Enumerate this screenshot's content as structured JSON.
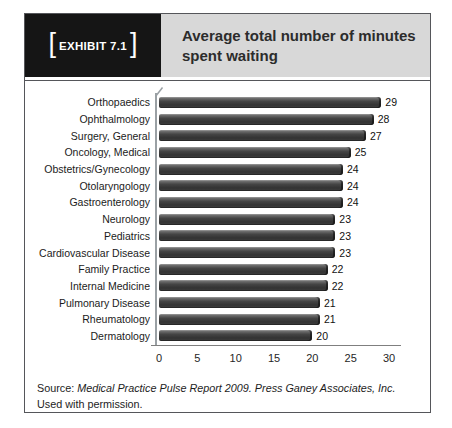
{
  "exhibit": {
    "bracket_left": "[",
    "label": "EXHIBIT 7.1",
    "bracket_right": "]"
  },
  "header": {
    "title": "Average total number of minutes spent waiting"
  },
  "chart_data": {
    "type": "bar",
    "orientation": "horizontal",
    "title": "Average total number of minutes spent waiting",
    "categories": [
      "Orthopaedics",
      "Ophthalmology",
      "Surgery, General",
      "Oncology, Medical",
      "Obstetrics/Gynecology",
      "Otolaryngology",
      "Gastroenterology",
      "Neurology",
      "Pediatrics",
      "Cardiovascular Disease",
      "Family Practice",
      "Internal Medicine",
      "Pulmonary Disease",
      "Rheumatology",
      "Dermatology"
    ],
    "values": [
      29,
      28,
      27,
      25,
      24,
      24,
      24,
      23,
      23,
      23,
      22,
      22,
      21,
      21,
      20
    ],
    "xlabel": "",
    "ylabel": "",
    "xlim": [
      0,
      30
    ],
    "xticks": [
      0,
      5,
      10,
      15,
      20,
      25,
      30
    ],
    "grid": false,
    "legend": "none",
    "value_labels_shown": true,
    "bar_color": "#3a3a3a",
    "bar_highlight_color": "#a0a0a0"
  },
  "source": {
    "prefix": "Source: ",
    "citation": "Medical Practice Pulse Report 2009. Press Ganey Associates, Inc.",
    "suffix": " Used with permission."
  }
}
